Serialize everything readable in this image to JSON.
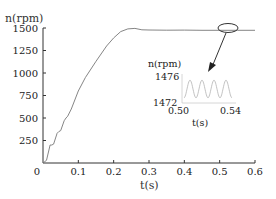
{
  "chart_data": {
    "type": "line",
    "title": "",
    "xlabel": "t(s)",
    "ylabel": "n(rpm)",
    "xlim": [
      0,
      0.6
    ],
    "ylim": [
      0,
      1500
    ],
    "x_ticks": [
      "0",
      "0.1",
      "0.2",
      "0.3",
      "0.4",
      "0.5",
      "0.6"
    ],
    "y_ticks": [
      "250",
      "500",
      "750",
      "1000",
      "1250",
      "1500"
    ],
    "grid": false,
    "legend": "none",
    "series": [
      {
        "name": "speed",
        "x": [
          0,
          0.01,
          0.02,
          0.025,
          0.03,
          0.04,
          0.045,
          0.05,
          0.06,
          0.065,
          0.07,
          0.08,
          0.09,
          0.1,
          0.12,
          0.15,
          0.18,
          0.2,
          0.22,
          0.24,
          0.26,
          0.28,
          0.3,
          0.35,
          0.4,
          0.45,
          0.5,
          0.55,
          0.6
        ],
        "y": [
          0,
          30,
          200,
          200,
          210,
          330,
          350,
          360,
          470,
          500,
          520,
          600,
          700,
          800,
          950,
          1130,
          1300,
          1390,
          1460,
          1490,
          1495,
          1480,
          1478,
          1476,
          1477,
          1475,
          1474,
          1475,
          1475
        ]
      }
    ],
    "inset": {
      "ylabel": "n(rpm)",
      "xlabel": "t(s)",
      "x_ticks": [
        "0.50",
        "0.54"
      ],
      "y_ticks": [
        "1476",
        "1472"
      ],
      "xlim": [
        0.5,
        0.54
      ],
      "ylim": [
        1471,
        1477
      ],
      "series": {
        "name": "speed-zoom",
        "description": "sinusoidal ripple, ~4 periods between 0.50 and 0.54 s, amplitude ~2 rpm around 1474",
        "x": [
          0.5,
          0.505,
          0.51,
          0.515,
          0.52,
          0.525,
          0.53,
          0.535,
          0.54
        ],
        "y": [
          1472,
          1476,
          1472,
          1476,
          1472,
          1476,
          1472,
          1476,
          1472
        ]
      }
    },
    "annotations": [
      "ellipse at t≈0.52 s marking zoom region",
      "arrow pointing from ellipse to inset"
    ]
  }
}
